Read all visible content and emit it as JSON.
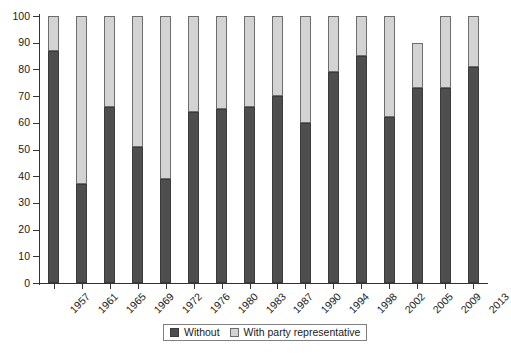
{
  "chart_data": {
    "type": "bar",
    "stacked": true,
    "stacked_percent": true,
    "title": "",
    "subtitle": "",
    "xlabel": "",
    "ylabel": "",
    "ylim": [
      0,
      100
    ],
    "yticks": [
      0,
      10,
      20,
      30,
      40,
      50,
      60,
      70,
      80,
      90,
      100
    ],
    "ytick_labels": [
      "0",
      "10",
      "20",
      "30",
      "40",
      "50",
      "60",
      "70",
      "80",
      "90",
      "100"
    ],
    "grid": false,
    "legend_position": "bottom",
    "categories": [
      "1957",
      "1961",
      "1965",
      "1969",
      "1972",
      "1976",
      "1980",
      "1983",
      "1987",
      "1990",
      "1994",
      "1998",
      "2002",
      "2005",
      "2009",
      "2013"
    ],
    "series": [
      {
        "name": "Without",
        "color": "#4e4e4e",
        "values": [
          87,
          37,
          66,
          51,
          39,
          64,
          65,
          66,
          70,
          60,
          79,
          85,
          62,
          73,
          73,
          81
        ]
      },
      {
        "name": "With party representative",
        "color": "#d3d3d3",
        "values": [
          13,
          63,
          34,
          49,
          61,
          36,
          35,
          34,
          30,
          40,
          21,
          15,
          38,
          17,
          27,
          19
        ]
      }
    ],
    "bar_totals": [
      100,
      100,
      100,
      100,
      100,
      100,
      100,
      100,
      100,
      100,
      100,
      100,
      100,
      90,
      100,
      100
    ],
    "annotations": []
  },
  "legend": {
    "items": [
      {
        "label": "Without",
        "swatch": "dark-swatch-icon"
      },
      {
        "label": "With party representative",
        "swatch": "light-swatch-icon"
      }
    ]
  }
}
